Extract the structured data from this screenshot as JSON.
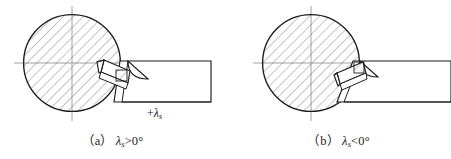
{
  "figure": {
    "type": "engineering-diagram",
    "background_color": "#ffffff",
    "line_color": "#1c1c1c",
    "hatch_color": "#555555",
    "centerline_color": "#8a8a8a"
  },
  "panels": [
    {
      "id": "a",
      "caption_prefix": "（a）",
      "caption_symbol": "λ",
      "caption_sub": "s",
      "caption_relation": ">0°",
      "angle_label_sign": "+",
      "angle_label_symbol": "λ",
      "angle_label_sub": "s",
      "workpiece": {
        "name": "workpiece-circle",
        "center_x": 72,
        "center_y": 63,
        "radius": 49,
        "hatched": true,
        "hatch_angle_deg": 45
      },
      "tool": {
        "name": "cutting-tool",
        "tilt": "positive",
        "shank_right_x": 211,
        "shank_top_y": 61,
        "shank_bottom_y": 102
      }
    },
    {
      "id": "b",
      "caption_prefix": "（b）",
      "caption_symbol": "λ",
      "caption_sub": "s",
      "caption_relation": "<0°",
      "angle_label_sign": "−",
      "angle_label_symbol": "λ",
      "angle_label_sub": "s",
      "workpiece": {
        "name": "workpiece-circle",
        "center_x": 85,
        "center_y": 63,
        "radius": 49,
        "hatched": true,
        "hatch_angle_deg": 45
      },
      "tool": {
        "name": "cutting-tool",
        "tilt": "negative",
        "shank_right_x": 225,
        "shank_top_y": 61,
        "shank_bottom_y": 102
      }
    }
  ]
}
